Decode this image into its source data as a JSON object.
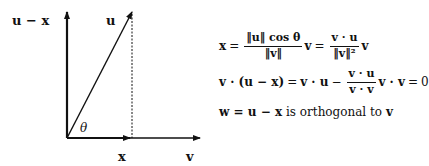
{
  "diagram": {
    "labels": {
      "u_minus_x": "u − x",
      "u": "u",
      "x": "x",
      "v": "v",
      "theta": "θ"
    },
    "geometry": {
      "origin": [
        67,
        138
      ],
      "vertical_axis_top": [
        67,
        12
      ],
      "horizontal_axis_end": [
        200,
        138
      ],
      "projection_point": [
        130,
        138
      ],
      "u_tip": [
        132,
        12
      ]
    }
  },
  "equations": {
    "line1": {
      "lhs": "x",
      "eq": "=",
      "frac1_num": "‖u‖ cos θ",
      "frac1_den": "‖v‖",
      "v1": "v",
      "eq2": "=",
      "frac2_num": "v · u",
      "frac2_den": "‖v‖²",
      "v2": "v"
    },
    "line2": {
      "lhs": "v · (u − x)",
      "eq": "=",
      "term1": "v · u",
      "minus": "−",
      "frac_num": "v · u",
      "frac_den": "v · v",
      "term2": "v · v",
      "eq2": "=",
      "rhs": "0"
    },
    "line3": {
      "lhs": "w = u − x",
      "text": "is orthogonal to",
      "rhs": "v"
    }
  }
}
